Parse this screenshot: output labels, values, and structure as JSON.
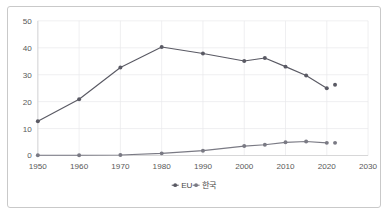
{
  "chart_data": {
    "type": "line",
    "title": "",
    "subtitle": "",
    "xlabel": "",
    "ylabel": "",
    "xlim": [
      1950,
      2030
    ],
    "ylim": [
      0,
      50
    ],
    "xticks": [
      1950,
      1960,
      1970,
      1980,
      1990,
      2000,
      2010,
      2020,
      2030
    ],
    "yticks": [
      0,
      10,
      20,
      30,
      40,
      50
    ],
    "grid": true,
    "legend_position": "bottom-center",
    "x": [
      1950,
      1960,
      1970,
      1980,
      1990,
      2000,
      2005,
      2010,
      2015,
      2020,
      2022
    ],
    "series": [
      {
        "name": "EU",
        "color": "#5a5a64",
        "marker": "circle",
        "values": [
          12.7,
          20.9,
          32.7,
          40.3,
          37.9,
          35.1,
          36.2,
          33.0,
          29.7,
          25.0,
          26.3
        ]
      },
      {
        "name": "한국",
        "color": "#7a7a84",
        "marker": "circle",
        "values": [
          0.1,
          0.1,
          0.2,
          0.8,
          1.8,
          3.5,
          4.0,
          4.9,
          5.2,
          4.7,
          4.7
        ]
      }
    ],
    "annotations": []
  },
  "legend": {
    "items": [
      {
        "label": "EU"
      },
      {
        "label": "한국"
      }
    ]
  },
  "axis": {
    "y_tick_labels": [
      "0",
      "10",
      "20",
      "30",
      "40",
      "50"
    ],
    "x_tick_labels": [
      "1950",
      "1960",
      "1970",
      "1980",
      "1990",
      "2000",
      "2010",
      "2020",
      "2030"
    ]
  },
  "colors": {
    "series_eu": "#5a5a64",
    "series_korea": "#7a7a84",
    "grid": "#e8e8ea",
    "frame_border": "#c9c9c9",
    "text": "#595959",
    "background": "#ffffff"
  }
}
